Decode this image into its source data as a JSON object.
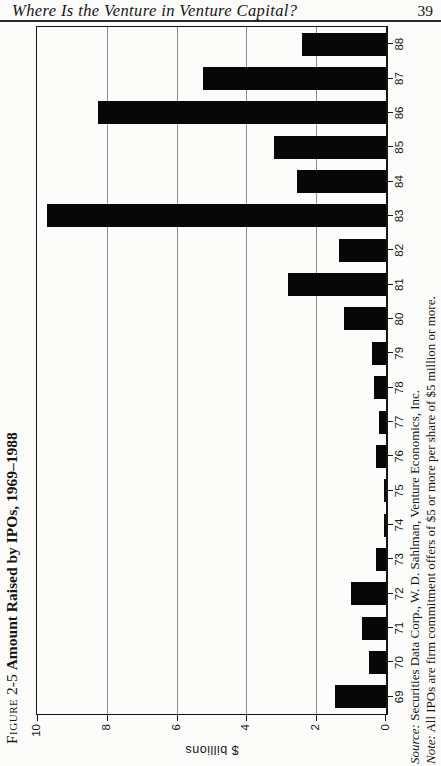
{
  "header": {
    "running_head": "Where Is the Venture in Venture Capital?",
    "page_number": "39"
  },
  "figure": {
    "label": "Figure",
    "number": "2-5",
    "title": "Amount Raised by IPOs, 1969–1988",
    "source_prefix": "Source:",
    "source_text": " Securities Data Corp., W. D. Sahlman, Venture Economics, Inc.",
    "note_prefix": "Note:",
    "note_text": " All IPOs are firm commitment offers of $5 or more per share of $5 million or more."
  },
  "chart_data": {
    "type": "bar",
    "title": "Figure 2-5 Amount Raised by IPOs, 1969–1988",
    "categories": [
      "69",
      "70",
      "71",
      "72",
      "73",
      "74",
      "75",
      "76",
      "77",
      "78",
      "79",
      "80",
      "81",
      "82",
      "83",
      "84",
      "85",
      "86",
      "87",
      "88"
    ],
    "values": [
      1.45,
      0.5,
      0.7,
      1.0,
      0.3,
      0.05,
      0.05,
      0.3,
      0.2,
      0.35,
      0.4,
      1.2,
      2.8,
      1.35,
      9.7,
      2.55,
      3.2,
      8.25,
      5.25,
      2.4
    ],
    "xlabel": "",
    "ylabel": "$ billions",
    "ylim": [
      0,
      10
    ],
    "yticks": [
      0,
      2,
      4,
      6,
      8,
      10
    ],
    "grid": true,
    "legend": "none",
    "bar_color": "#070707",
    "layout_hint": "landscape figure printed rotated 90° counterclockwise on a portrait book page; years read bottom-to-top along right edge"
  }
}
